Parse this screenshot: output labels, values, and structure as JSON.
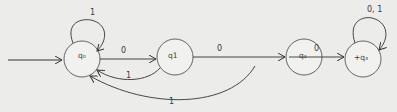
{
  "diagram": {
    "type": "finite-automaton",
    "states": [
      {
        "id": "q0",
        "label": "q₀",
        "start": true,
        "final": false
      },
      {
        "id": "q1",
        "label": "q1",
        "start": false,
        "final": false
      },
      {
        "id": "q2",
        "label": "q₂",
        "start": false,
        "final": false
      },
      {
        "id": "q3",
        "label": "+q₃",
        "start": false,
        "final": true
      }
    ],
    "transitions": [
      {
        "from": "q0",
        "to": "q0",
        "label": "1"
      },
      {
        "from": "q0",
        "to": "q1",
        "label": "0"
      },
      {
        "from": "q1",
        "to": "q0",
        "label": "1"
      },
      {
        "from": "q1",
        "to": "q2",
        "label": "0"
      },
      {
        "from": "q2",
        "to": "q0",
        "label": "1"
      },
      {
        "from": "q2",
        "to": "q3",
        "label": "0"
      },
      {
        "from": "q3",
        "to": "q3",
        "label": "0, 1"
      }
    ]
  }
}
